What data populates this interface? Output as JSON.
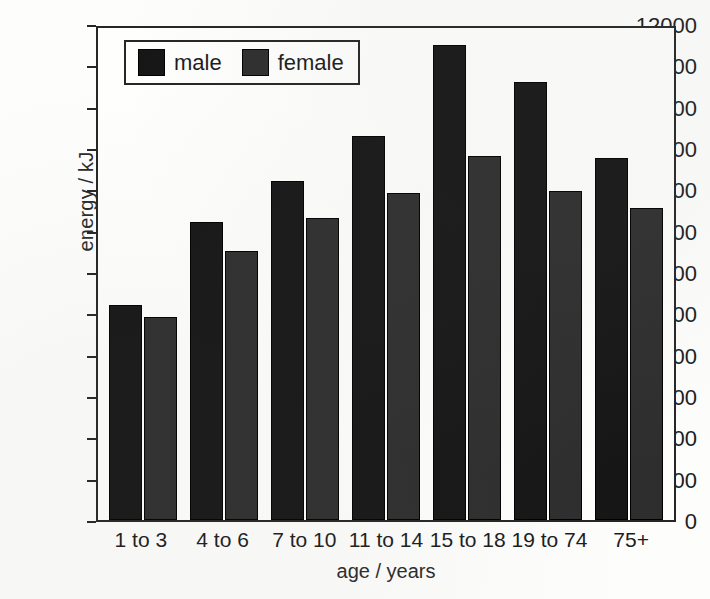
{
  "chart_data": {
    "type": "bar",
    "title": "",
    "xlabel": "age / years",
    "ylabel": "energy / kJ",
    "categories": [
      "1 to 3",
      "4 to 6",
      "7 to 10",
      "11 to 14",
      "15 to 18",
      "19 to 74",
      "75+"
    ],
    "series": [
      {
        "name": "male",
        "color": "#161616",
        "values": [
          5200,
          7200,
          8200,
          9300,
          11500,
          10600,
          8750
        ]
      },
      {
        "name": "female",
        "color": "#2e2e2e",
        "values": [
          4900,
          6500,
          7300,
          7900,
          8800,
          7950,
          7550
        ]
      }
    ],
    "ylim": [
      0,
      12000
    ],
    "ytick_step": 1000,
    "yticks": [
      "12000",
      "11000",
      "10000",
      "9000",
      "8000",
      "7000",
      "6000",
      "5000",
      "4000",
      "3000",
      "2000",
      "1000",
      "0"
    ],
    "grid": false,
    "legend_position": "top-left-inside",
    "legend_entries": [
      "male",
      "female"
    ]
  },
  "axes": {
    "y_title": "energy / kJ",
    "x_title": "age / years"
  },
  "legend": {
    "items": [
      {
        "label": "male"
      },
      {
        "label": "female"
      }
    ]
  },
  "colors": {
    "male": "#161616",
    "female": "#2e2e2e",
    "frame": "#262626",
    "background": "#fdfdfc"
  }
}
